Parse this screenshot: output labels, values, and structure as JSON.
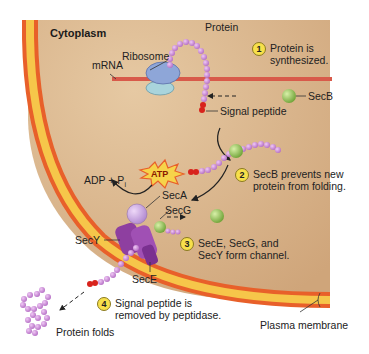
{
  "region_label": "Cytoplasm",
  "labels": {
    "protein": "Protein",
    "ribosome": "Ribosome",
    "mrna": "mRNA",
    "secb": "SecB",
    "signal_peptide": "Signal peptide",
    "adp_pi": "ADP + P",
    "adp_pi_sub": "i",
    "atp": "ATP",
    "seca": "SecA",
    "secg": "SecG",
    "secy": "SecY",
    "sece": "SecE",
    "protein_folds": "Protein folds",
    "plasma_membrane": "Plasma membrane"
  },
  "steps": [
    {
      "num": "1",
      "text_line1": "Protein is",
      "text_line2": "synthesized."
    },
    {
      "num": "2",
      "text_line1": "SecB prevents new",
      "text_line2": "protein from folding."
    },
    {
      "num": "3",
      "text_line1": "SecE, SecG, and",
      "text_line2": "SecY form channel."
    },
    {
      "num": "4",
      "text_line1": "Signal peptide is",
      "text_line2": "removed by peptidase."
    }
  ],
  "colors": {
    "cytoplasm": "#d9b48a",
    "membrane_outer": "#e8602a",
    "membrane_inner": "#f6c64a",
    "protein_bead": "#c98ad6",
    "secb": "#8fbf4a",
    "signal": "#d8231c",
    "secy": "#8e3fa0",
    "ribosome_large": "#8ea6d8",
    "ribosome_small": "#a9d4dc",
    "mrna": "#d85a4a"
  }
}
